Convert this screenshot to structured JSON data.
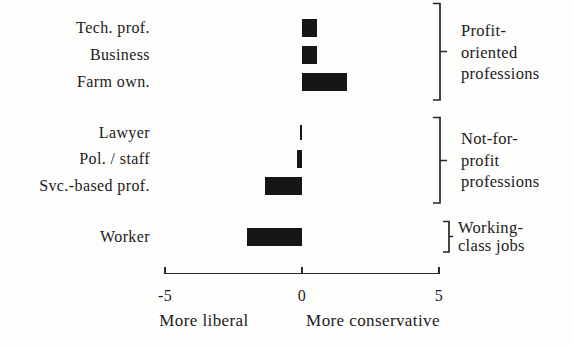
{
  "chart_data": {
    "type": "bar",
    "orientation": "horizontal",
    "title": "",
    "xlabel_left": "More liberal",
    "xlabel_right": "More conservative",
    "xlim": [
      -5,
      5
    ],
    "x_ticks": [
      "-5",
      "0",
      "5"
    ],
    "x_tick_values": [
      -5,
      0,
      5
    ],
    "grid": false,
    "bar_color": "#161616",
    "categories": [
      "Tech. prof.",
      "Business",
      "Farm own.",
      "Lawyer",
      "Pol. / staff",
      "Svc.-based prof.",
      "Worker"
    ],
    "values": [
      0.55,
      0.55,
      1.65,
      -0.03,
      -0.2,
      -1.35,
      -2.0
    ],
    "groups": [
      {
        "label_lines": [
          "Profit-",
          "oriented",
          "professions"
        ],
        "categories": [
          "Tech. prof.",
          "Business",
          "Farm own."
        ]
      },
      {
        "label_lines": [
          "Not-for-",
          "profit",
          "professions"
        ],
        "categories": [
          "Lawyer",
          "Pol. / staff",
          "Svc.-based prof."
        ]
      },
      {
        "label_lines": [
          "Working-",
          "class jobs"
        ],
        "categories": [
          "Worker"
        ]
      }
    ]
  }
}
